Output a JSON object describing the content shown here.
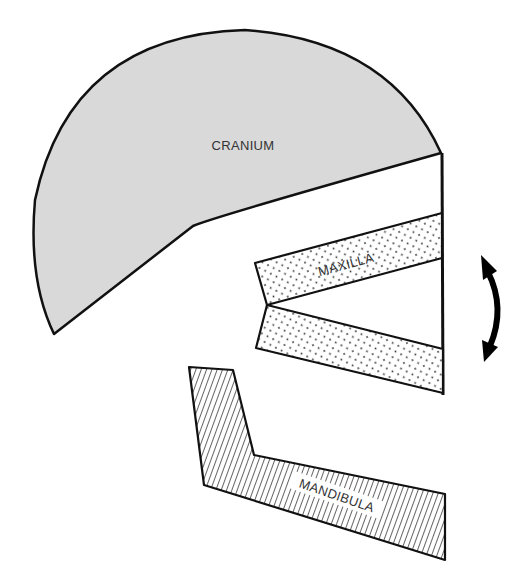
{
  "diagram": {
    "labels": {
      "cranium": "CRANIUM",
      "maxilla": "MAXILLA",
      "mandibula": "MANDIBULA"
    },
    "icons": {
      "motion_arrow": "curved-double-arrow-icon"
    },
    "colors": {
      "cranium_fill": "#d9d9d9",
      "outline": "#111111",
      "background": "#ffffff"
    }
  }
}
